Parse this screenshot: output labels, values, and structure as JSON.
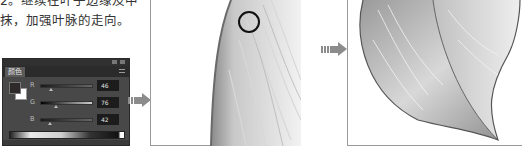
{
  "caption": {
    "line1": "2。继续在叶子边缘及中",
    "line2": "抹，加强叶脉的走向。"
  },
  "color_panel": {
    "tab_label": "颜色",
    "foreground_color": "#2e2a2a",
    "background_color": "#ffffff",
    "channels": [
      {
        "label": "R",
        "value": "46"
      },
      {
        "label": "G",
        "value": "76"
      },
      {
        "label": "B",
        "value": "42"
      }
    ]
  },
  "canvas_mid": {
    "brush_cursor": "circle-brush-cursor"
  },
  "canvas_right": {
    "subject": "pencil-shaded-leaf"
  },
  "colors": {
    "panel_bg": "#484848",
    "arrow": "#8c8c8c",
    "frame_border": "#9a9a9a"
  }
}
